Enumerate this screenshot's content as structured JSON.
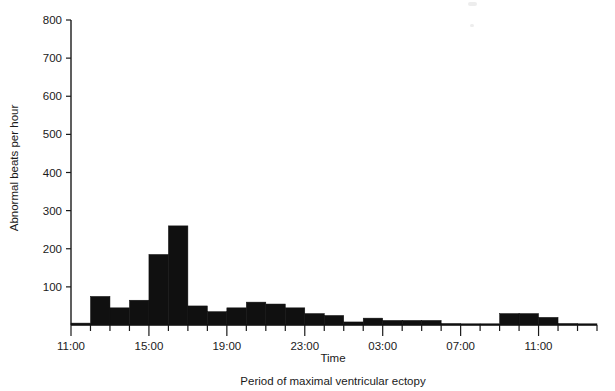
{
  "figure": {
    "caption": "Period of maximal ventricular ectopy"
  },
  "axes": {
    "y_title": "Abnormal beats per hour",
    "x_title": "Time",
    "y_ticks": [
      "0",
      "100",
      "200",
      "300",
      "400",
      "500",
      "600",
      "700",
      "800"
    ],
    "x_tick_labels": [
      "11:00",
      "15:00",
      "19:00",
      "23:00",
      "03:00",
      "07:00",
      "11:00"
    ]
  },
  "chart_data": {
    "type": "bar",
    "title": "",
    "subtitle": "",
    "xlabel": "Time",
    "ylabel": "Abnormal beats per hour",
    "annotation": "Period of maximal ventricular ectopy",
    "ylim": [
      0,
      800
    ],
    "ytick_values": [
      0,
      100,
      200,
      300,
      400,
      500,
      600,
      700,
      800
    ],
    "grid": false,
    "legend": "none",
    "xlim_hours": [
      11,
      38
    ],
    "xtick_hours": [
      11,
      15,
      19,
      23,
      27,
      31,
      35
    ],
    "xtick_labels": [
      "11:00",
      "15:00",
      "19:00",
      "23:00",
      "03:00",
      "07:00",
      "11:00"
    ],
    "bar_width_hours": 1,
    "categories": [
      "11:00",
      "12:00",
      "13:00",
      "14:00",
      "15:00",
      "16:00",
      "17:00",
      "18:00",
      "19:00",
      "20:00",
      "21:00",
      "22:00",
      "23:00",
      "00:00",
      "01:00",
      "02:00",
      "03:00",
      "04:00",
      "05:00",
      "06:00",
      "07:00",
      "08:00",
      "09:00",
      "10:00",
      "11:00",
      "12:00",
      "13:00"
    ],
    "values": [
      5,
      75,
      45,
      65,
      185,
      260,
      50,
      35,
      45,
      60,
      55,
      45,
      30,
      25,
      8,
      18,
      12,
      12,
      12,
      4,
      3,
      3,
      30,
      30,
      20,
      4,
      2
    ]
  }
}
